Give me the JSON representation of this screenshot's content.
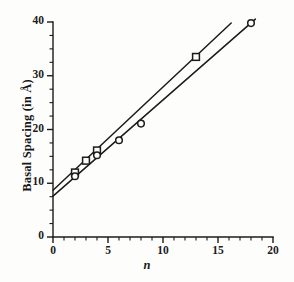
{
  "figure": {
    "background_color": "#fdfdfc",
    "ink_color": "#1b1b1b"
  },
  "chart_data": {
    "type": "scatter",
    "title": "",
    "xlabel": "n",
    "ylabel": "Basal Spacing (in Å)",
    "xlim": [
      0,
      20
    ],
    "ylim": [
      0,
      40
    ],
    "grid": false,
    "legend_position": "none",
    "x_ticks": [
      0,
      5,
      10,
      15,
      20
    ],
    "x_tick_labels": [
      "0",
      "5",
      "10",
      "15",
      "20"
    ],
    "x_minor_step": 1,
    "y_ticks": [
      0,
      10,
      20,
      30,
      40
    ],
    "y_tick_labels": [
      "0",
      "10",
      "20",
      "30",
      "40"
    ],
    "y_minor_step": 2.5,
    "series": [
      {
        "name": "series-squares",
        "marker": "square",
        "marker_filled": false,
        "points": [
          {
            "x": 2,
            "y": 12.0
          },
          {
            "x": 3,
            "y": 14.2
          },
          {
            "x": 4,
            "y": 16.1
          },
          {
            "x": 13,
            "y": 33.5
          }
        ],
        "fit_line": {
          "intercept": 8.7,
          "slope": 1.92,
          "x_start": 0.0,
          "x_end": 16.2
        }
      },
      {
        "name": "series-circles",
        "marker": "circle",
        "marker_filled": false,
        "points": [
          {
            "x": 2,
            "y": 11.3
          },
          {
            "x": 4,
            "y": 15.2
          },
          {
            "x": 6,
            "y": 18.0
          },
          {
            "x": 8,
            "y": 21.1
          },
          {
            "x": 18,
            "y": 39.8
          }
        ],
        "fit_line": {
          "intercept": 7.6,
          "slope": 1.79,
          "x_start": 0.0,
          "x_end": 18.4
        }
      }
    ]
  },
  "axes": {
    "x_axis_name": "x-axis",
    "y_axis_name": "y-axis"
  }
}
